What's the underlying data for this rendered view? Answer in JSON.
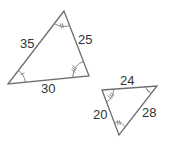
{
  "diagram": {
    "triangles": [
      {
        "id": "triangle-large",
        "vertices": {
          "top": [
            64,
            11
          ],
          "bottom_left": [
            8,
            84
          ],
          "bottom_right": [
            89,
            76
          ]
        },
        "side_labels": {
          "left": "35",
          "right": "25",
          "bottom": "30"
        },
        "angle_marks": {
          "top": "double-tick arc",
          "bottom_left": "single-tick arc",
          "bottom_right": "triple-tick arc"
        }
      },
      {
        "id": "triangle-small",
        "vertices": {
          "top_left": [
            102,
            90
          ],
          "top_right": [
            157,
            86
          ],
          "bottom": [
            119,
            135
          ]
        },
        "side_labels": {
          "top": "24",
          "left": "20",
          "right": "28"
        },
        "angle_marks": {
          "top_left": "triple-tick arc",
          "top_right": "single-tick arc",
          "bottom": "double-tick arc"
        }
      }
    ],
    "colors": {
      "stroke": "#6e6e6e",
      "text": "#333333",
      "background": "#ffffff"
    }
  }
}
